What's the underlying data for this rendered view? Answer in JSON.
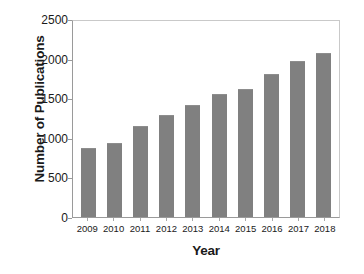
{
  "chart_data": {
    "type": "bar",
    "title": "",
    "xlabel": "Year",
    "ylabel": "Number of Publications",
    "categories": [
      "2009",
      "2010",
      "2011",
      "2012",
      "2013",
      "2014",
      "2015",
      "2016",
      "2017",
      "2018"
    ],
    "values": [
      870,
      935,
      1150,
      1290,
      1415,
      1555,
      1615,
      1805,
      1970,
      2070
    ],
    "ylim": [
      0,
      2500
    ],
    "yticks": [
      0,
      500,
      1000,
      1500,
      2000,
      2500
    ],
    "ytick_labels": [
      "0",
      "500",
      "1000",
      "1500",
      "2000",
      "2500"
    ],
    "grid": false,
    "legend": "none",
    "bar_color": "#808080",
    "axis_color": "#9a9a9a",
    "background_color": "#ffffff"
  }
}
